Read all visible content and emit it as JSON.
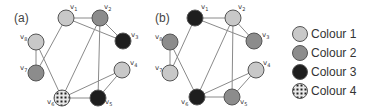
{
  "colors": {
    "colour1": "#c8c8c8",
    "colour2": "#8c8c8c",
    "colour3": "#1e1e1e",
    "colour4_bg": "#e8e8e8",
    "colour4_fg": "#222222"
  },
  "graphs": [
    {
      "label": "(a)",
      "label_pos": [
        14,
        22
      ],
      "nodes": [
        {
          "id": "v1",
          "label": "v1",
          "x": 66,
          "y": 18,
          "colour": "colour1",
          "lx": 70,
          "ly": 9
        },
        {
          "id": "v2",
          "label": "v2",
          "x": 100,
          "y": 18,
          "colour": "colour2",
          "lx": 104,
          "ly": 9
        },
        {
          "id": "v3",
          "label": "v3",
          "x": 123,
          "y": 41,
          "colour": "colour3",
          "lx": 131,
          "ly": 37
        },
        {
          "id": "v4",
          "label": "v4",
          "x": 122,
          "y": 70,
          "colour": "colour1",
          "lx": 130,
          "ly": 65
        },
        {
          "id": "v5",
          "label": "v5",
          "x": 98,
          "y": 98,
          "colour": "colour3",
          "lx": 105,
          "ly": 104
        },
        {
          "id": "v6",
          "label": "v6",
          "x": 62,
          "y": 98,
          "colour": "colour4",
          "lx": 47,
          "ly": 104
        },
        {
          "id": "v7",
          "label": "v7",
          "x": 36,
          "y": 73,
          "colour": "colour2",
          "lx": 20,
          "ly": 70
        },
        {
          "id": "v8",
          "label": "v8",
          "x": 36,
          "y": 42,
          "colour": "colour1",
          "lx": 20,
          "ly": 39
        }
      ],
      "edges": [
        [
          "v1",
          "v2"
        ],
        [
          "v1",
          "v3"
        ],
        [
          "v2",
          "v3"
        ],
        [
          "v1",
          "v7"
        ],
        [
          "v8",
          "v7"
        ],
        [
          "v8",
          "v6"
        ],
        [
          "v2",
          "v6"
        ],
        [
          "v2",
          "v5"
        ],
        [
          "v4",
          "v6"
        ],
        [
          "v4",
          "v5"
        ],
        [
          "v5",
          "v6"
        ]
      ]
    },
    {
      "label": "(b)",
      "label_pos": [
        155,
        22
      ],
      "nodes": [
        {
          "id": "v1",
          "label": "v1",
          "x": 195,
          "y": 18,
          "colour": "colour3",
          "lx": 201,
          "ly": 9
        },
        {
          "id": "v2",
          "label": "v2",
          "x": 233,
          "y": 18,
          "colour": "colour1",
          "lx": 238,
          "ly": 9
        },
        {
          "id": "v3",
          "label": "v3",
          "x": 254,
          "y": 41,
          "colour": "colour2",
          "lx": 262,
          "ly": 37
        },
        {
          "id": "v4",
          "label": "v4",
          "x": 256,
          "y": 70,
          "colour": "colour1",
          "lx": 263,
          "ly": 65
        },
        {
          "id": "v5",
          "label": "v5",
          "x": 232,
          "y": 97,
          "colour": "colour2",
          "lx": 240,
          "ly": 104
        },
        {
          "id": "v6",
          "label": "v6",
          "x": 197,
          "y": 97,
          "colour": "colour3",
          "lx": 181,
          "ly": 104
        },
        {
          "id": "v7",
          "label": "v7",
          "x": 170,
          "y": 73,
          "colour": "colour1",
          "lx": 155,
          "ly": 70
        },
        {
          "id": "v8",
          "label": "v8",
          "x": 170,
          "y": 42,
          "colour": "colour2",
          "lx": 155,
          "ly": 39
        }
      ],
      "edges": [
        [
          "v1",
          "v2"
        ],
        [
          "v1",
          "v3"
        ],
        [
          "v2",
          "v3"
        ],
        [
          "v1",
          "v7"
        ],
        [
          "v8",
          "v7"
        ],
        [
          "v8",
          "v6"
        ],
        [
          "v2",
          "v6"
        ],
        [
          "v2",
          "v5"
        ],
        [
          "v4",
          "v6"
        ],
        [
          "v4",
          "v5"
        ],
        [
          "v5",
          "v6"
        ]
      ]
    }
  ],
  "legend": [
    {
      "label": "Colour 1",
      "colour": "colour1"
    },
    {
      "label": "Colour 2",
      "colour": "colour2"
    },
    {
      "label": "Colour 3",
      "colour": "colour3"
    },
    {
      "label": "Colour 4",
      "colour": "colour4"
    }
  ]
}
